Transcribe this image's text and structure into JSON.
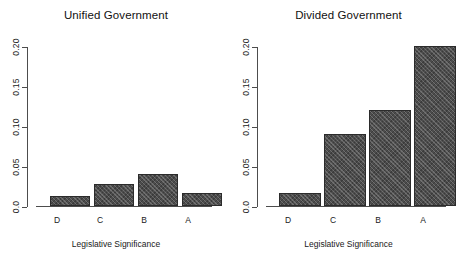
{
  "chart_data": [
    {
      "type": "bar",
      "title": "Unified Government",
      "categories": [
        "D",
        "C",
        "B",
        "A"
      ],
      "values": [
        0.013,
        0.028,
        0.04,
        0.016
      ],
      "xlabel": "Legislative Significance",
      "ylabel": "",
      "ylim": [
        0.0,
        0.2
      ],
      "yticks": [
        0.0,
        0.05,
        0.1,
        0.15,
        0.2
      ],
      "ytick_labels": [
        "0.0",
        "0.05",
        "0.10",
        "0.15",
        "0.20"
      ],
      "grid": false,
      "legend": null,
      "bar_color": "#4c4c4c",
      "bar_border_color": "#2b2b2b",
      "axis_color": "#4d4d4d",
      "background": "#ffffff"
    },
    {
      "type": "bar",
      "title": "Divided Government",
      "categories": [
        "D",
        "C",
        "B",
        "A"
      ],
      "values": [
        0.016,
        0.09,
        0.12,
        0.2
      ],
      "xlabel": "Legislative Significance",
      "ylabel": "",
      "ylim": [
        0.0,
        0.2
      ],
      "yticks": [
        0.0,
        0.05,
        0.1,
        0.15,
        0.2
      ],
      "ytick_labels": [
        "0.0",
        "0.05",
        "0.10",
        "0.15",
        "0.20"
      ],
      "grid": false,
      "legend": null,
      "bar_color": "#4c4c4c",
      "bar_border_color": "#2b2b2b",
      "axis_color": "#4d4d4d",
      "background": "#ffffff"
    }
  ],
  "panels": {
    "left": {
      "title": "Unified Government",
      "axis_title": "Legislative Significance",
      "ytick_labels": [
        "0.0",
        "0.05",
        "0.10",
        "0.15",
        "0.20"
      ],
      "categories": [
        "D",
        "C",
        "B",
        "A"
      ]
    },
    "right": {
      "title": "Divided Government",
      "axis_title": "Legislative Significance",
      "ytick_labels": [
        "0.0",
        "0.05",
        "0.10",
        "0.15",
        "0.20"
      ],
      "categories": [
        "D",
        "C",
        "B",
        "A"
      ]
    }
  }
}
